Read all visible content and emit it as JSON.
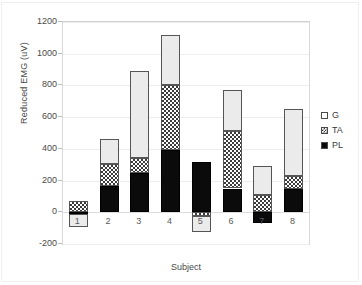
{
  "chart_data": {
    "type": "bar",
    "subtype": "stacked-bar",
    "title": "",
    "xlabel": "Subject",
    "ylabel": "Reduced EMG (uV)",
    "categories": [
      "1",
      "2",
      "3",
      "4",
      "5",
      "6",
      "7",
      "8"
    ],
    "series": [
      {
        "name": "PL",
        "values": [
          -10,
          165,
          245,
          390,
          315,
          150,
          -70,
          145
        ]
      },
      {
        "name": "TA",
        "values": [
          70,
          140,
          100,
          410,
          -25,
          360,
          110,
          85
        ]
      },
      {
        "name": "G",
        "values": [
          -85,
          160,
          545,
          320,
          -100,
          260,
          185,
          420
        ]
      }
    ],
    "totals": [
      -25,
      465,
      890,
      1120,
      190,
      770,
      225,
      650
    ],
    "ylim": [
      -200,
      1200
    ],
    "yticks": [
      -200,
      0,
      200,
      400,
      600,
      800,
      1000,
      1200
    ],
    "ytick_labels": [
      "-200",
      "0",
      "200",
      "400",
      "600",
      "800",
      "1000",
      "1200"
    ],
    "grid": true,
    "legend_position": "right",
    "legend_entries": [
      {
        "label": "G",
        "fill": "white"
      },
      {
        "label": "TA",
        "fill": "checkered"
      },
      {
        "label": "PL",
        "fill": "black"
      }
    ],
    "colors": {
      "PL": "#0b0b0b",
      "TA": "#ffffff",
      "G": "#ebebeb",
      "outline": "#4a4a4a",
      "grid": "#ededed",
      "axis": "#d8d8d8"
    }
  }
}
